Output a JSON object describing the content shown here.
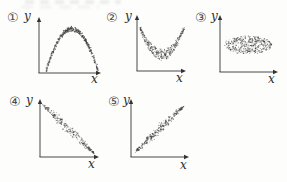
{
  "figure": {
    "kind": "five-scatter-plot-figure",
    "axis_color": "#333333",
    "dot_color": "#3f3f3f"
  },
  "chart_data": [
    {
      "type": "scatter",
      "label": "①",
      "xlabel": "x",
      "ylabel": "y",
      "pattern": "inverted-u-arch",
      "relationship": "strong nonlinear (inverted parabola)",
      "n_points": 520,
      "frame": {
        "ox": 39,
        "oy": 73,
        "top": 18,
        "right": 100,
        "num": [
          7,
          11
        ],
        "ylab": [
          24,
          10
        ],
        "xlab": [
          91,
          73
        ]
      },
      "gen": {
        "seed": 101,
        "x0": 46,
        "x1": 98,
        "y_base": 71,
        "height": 42,
        "noise": 2.4
      }
    },
    {
      "type": "scatter",
      "label": "②",
      "xlabel": "x",
      "ylabel": "y",
      "pattern": "u-shaped-crescent",
      "relationship": "strong nonlinear (upward-opening U)",
      "n_points": 380,
      "frame": {
        "ox": 137,
        "oy": 71,
        "top": 16,
        "right": 185,
        "num": [
          106,
          11
        ],
        "ylab": [
          125,
          10
        ],
        "xlab": [
          176,
          72
        ]
      },
      "gen": {
        "seed": 202,
        "x0": 140,
        "x1": 184,
        "y_top": 29,
        "depth": 31,
        "thick_min": 2,
        "thick_max": 11
      }
    },
    {
      "type": "scatter",
      "label": "③",
      "xlabel": "x",
      "ylabel": "y",
      "pattern": "horizontal-ellipse-cloud",
      "relationship": "no correlation (flat oval cloud)",
      "n_points": 430,
      "frame": {
        "ox": 220,
        "oy": 72,
        "top": 16,
        "right": 277,
        "num": [
          195,
          11
        ],
        "ylab": [
          211,
          10
        ],
        "xlab": [
          268,
          73
        ]
      },
      "gen": {
        "seed": 303,
        "cx": 248,
        "cy": 45,
        "rx": 24,
        "ry": 9
      }
    },
    {
      "type": "scatter",
      "label": "④",
      "xlabel": "x",
      "ylabel": "y",
      "pattern": "negative-linear-lens",
      "relationship": "negative correlation",
      "n_points": 280,
      "frame": {
        "ox": 40,
        "oy": 157,
        "top": 100,
        "right": 98,
        "num": [
          9,
          95
        ],
        "ylab": [
          26,
          94
        ],
        "xlab": [
          88,
          158
        ]
      },
      "gen": {
        "seed": 404,
        "x0": 42,
        "x1": 94,
        "y0": 104,
        "y1": 153,
        "w_mid": 6.5,
        "w_end": 1
      }
    },
    {
      "type": "scatter",
      "label": "⑤",
      "xlabel": "x",
      "ylabel": "y",
      "pattern": "positive-linear-lens",
      "relationship": "positive correlation",
      "n_points": 310,
      "frame": {
        "ox": 131,
        "oy": 157,
        "top": 100,
        "right": 188,
        "num": [
          108,
          95
        ],
        "ylab": [
          123,
          94
        ],
        "xlab": [
          180,
          159
        ]
      },
      "gen": {
        "seed": 505,
        "x0": 135,
        "x1": 184,
        "y0": 152,
        "y1": 106,
        "w_mid": 6,
        "w_end": 1
      }
    }
  ]
}
